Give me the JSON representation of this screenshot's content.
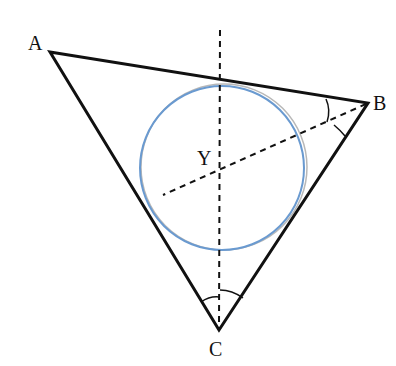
{
  "diagram": {
    "type": "triangle-incircle",
    "vertices": {
      "A": {
        "label": "A",
        "x": 50,
        "y": 52
      },
      "B": {
        "label": "B",
        "x": 368,
        "y": 103
      },
      "C": {
        "label": "C",
        "x": 219,
        "y": 330
      }
    },
    "incenter": {
      "label": "Y",
      "x": 220,
      "y": 168
    },
    "incircle": {
      "cx": 222,
      "cy": 168,
      "r": 83,
      "color": "#6a9ad0"
    },
    "bisectors": [
      {
        "from": "C",
        "name": "angle-bisector-C",
        "x1": 219,
        "y1": 330,
        "x2": 220,
        "y2": 28
      },
      {
        "from": "B",
        "name": "angle-bisector-B",
        "x1": 368,
        "y1": 103,
        "x2": 163,
        "y2": 195
      }
    ],
    "angle_marks": [
      "B (two arcs)",
      "C (two arcs)"
    ],
    "colors": {
      "lines": "#111111",
      "circle": "#6a9ad0"
    }
  }
}
